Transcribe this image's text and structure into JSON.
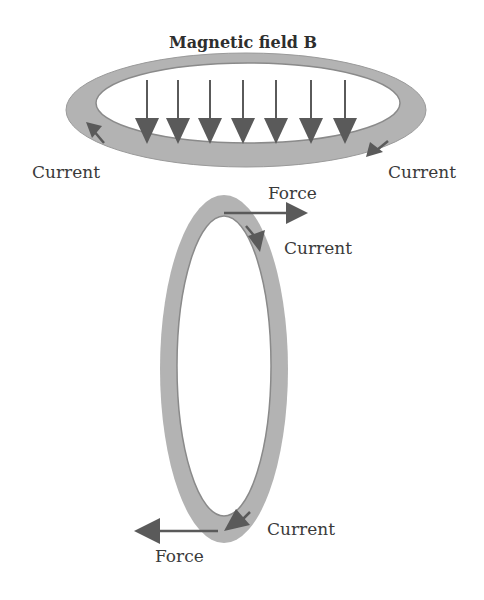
{
  "title": "Magnetic field B",
  "labels": {
    "top_left_current": "Current",
    "top_right_current": "Current",
    "top_force": "Force",
    "upper_current": "Current",
    "bottom_current": "Current",
    "bottom_force": "Force"
  },
  "colors": {
    "ring": "#b3b3b3",
    "ring_edge": "#8a8a8a",
    "arrow": "#5a5a5a",
    "text": "#3a3a3a"
  },
  "field_arrows": {
    "count": 7,
    "x_positions": [
      147,
      178,
      210,
      243,
      276,
      311,
      345
    ]
  }
}
